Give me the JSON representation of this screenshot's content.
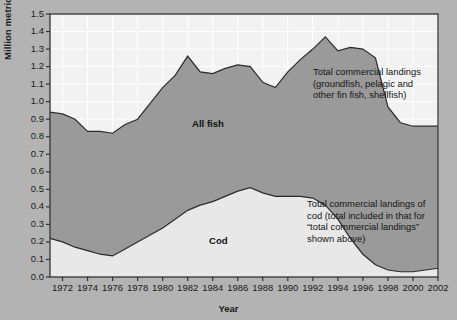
{
  "chart_data": {
    "type": "area",
    "title": "",
    "xlabel": "Year",
    "ylabel": "Million metric tonnes (live weight)",
    "xlim": [
      1971,
      2002
    ],
    "ylim": [
      0.0,
      1.5
    ],
    "grid": true,
    "legend": "none",
    "x_tick_labels": [
      "1972",
      "1974",
      "1976",
      "1978",
      "1980",
      "1982",
      "1984",
      "1986",
      "1988",
      "1990",
      "1992",
      "1994",
      "1996",
      "1998",
      "2000",
      "2002"
    ],
    "y_tick_labels": [
      "0.0",
      "0.1",
      "0.2",
      "0.3",
      "0.4",
      "0.5",
      "0.6",
      "0.7",
      "0.8",
      "0.9",
      "1.0",
      "1.1",
      "1.2",
      "1.3",
      "1.4",
      "1.5"
    ],
    "x": [
      1971,
      1972,
      1973,
      1974,
      1975,
      1976,
      1977,
      1978,
      1979,
      1980,
      1981,
      1982,
      1983,
      1984,
      1985,
      1986,
      1987,
      1988,
      1989,
      1990,
      1991,
      1992,
      1993,
      1994,
      1995,
      1996,
      1997,
      1998,
      1999,
      2000,
      2001,
      2002
    ],
    "series": [
      {
        "name": "All fish",
        "label": "All fish",
        "color": "#9a9a9a",
        "values": [
          0.94,
          0.93,
          0.9,
          0.83,
          0.83,
          0.82,
          0.87,
          0.9,
          0.99,
          1.08,
          1.15,
          1.26,
          1.17,
          1.16,
          1.19,
          1.21,
          1.2,
          1.11,
          1.08,
          1.17,
          1.24,
          1.3,
          1.37,
          1.29,
          1.31,
          1.3,
          1.25,
          0.97,
          0.88,
          0.86,
          0.86,
          0.86
        ]
      },
      {
        "name": "Cod",
        "label": "Cod",
        "color": "#e8e8e8",
        "values": [
          0.22,
          0.2,
          0.17,
          0.15,
          0.13,
          0.12,
          0.16,
          0.2,
          0.24,
          0.28,
          0.33,
          0.38,
          0.41,
          0.43,
          0.46,
          0.49,
          0.51,
          0.48,
          0.46,
          0.46,
          0.46,
          0.45,
          0.41,
          0.33,
          0.22,
          0.13,
          0.07,
          0.04,
          0.03,
          0.03,
          0.04,
          0.05
        ]
      }
    ],
    "annotations": [
      {
        "name": "total-commercial-landings-note",
        "text": "Total commercial landings\n(groundfish, pelagic and\nother fin fish, shellfish)",
        "x": 313,
        "y": 66
      },
      {
        "name": "cod-landings-note",
        "text": "Total commercial landings of\ncod (total included in that for\n“total commercial landings”\nshown above)",
        "x": 307,
        "y": 198
      }
    ],
    "series_labels": [
      {
        "name": "all-fish-label",
        "text": "All fish",
        "x": 192,
        "y": 118
      },
      {
        "name": "cod-label",
        "text": "Cod",
        "x": 209,
        "y": 235
      }
    ],
    "colors": {
      "background": "#b3b3b3",
      "plot_background": "#f2f2f2",
      "all_fish_fill": "#9a9a9a",
      "cod_fill": "#e9e9e9",
      "line": "#2b2b2b",
      "gridline": "#ffffff",
      "axis": "#333333"
    }
  }
}
